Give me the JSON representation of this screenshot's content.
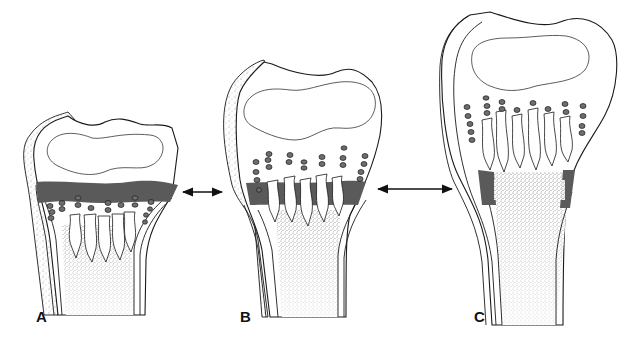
{
  "figure": {
    "panels": [
      {
        "id": "A",
        "label": "A",
        "description": "Open growth plate: dark uniform physis band beneath epiphysis with chondrocyte columns"
      },
      {
        "id": "B",
        "label": "B",
        "description": "Narrowing physis: columns extending through thinned dark band"
      },
      {
        "id": "C",
        "label": "C",
        "description": "Closing physis: dark band only at periphery, central metaphysis stippled"
      }
    ],
    "arrows": [
      {
        "from": "A",
        "to": "B",
        "type": "double-headed"
      },
      {
        "from": "B",
        "to": "C",
        "type": "double-headed"
      }
    ],
    "colors": {
      "physis": "#5a5a5a",
      "outline": "#1a1a1a",
      "background": "#ffffff",
      "stipple": "#8a8a8a"
    }
  }
}
